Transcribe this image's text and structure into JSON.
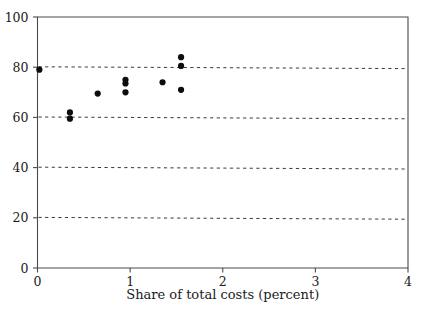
{
  "chart_data": {
    "type": "scatter",
    "title": "",
    "xlabel": "Share of total costs (percent)",
    "ylabel": "",
    "xlim": [
      0,
      4
    ],
    "ylim": [
      0,
      100
    ],
    "xticks": [
      0,
      1,
      2,
      3,
      4
    ],
    "xtick_labels": [
      "0",
      "1",
      "2",
      "3",
      "4"
    ],
    "yticks": [
      0,
      20,
      40,
      60,
      80,
      100
    ],
    "ytick_labels": [
      "0",
      "20",
      "40",
      "60",
      "80",
      "100"
    ],
    "grid": "horizontal-dashed",
    "gridline_values": [
      20,
      40,
      60,
      80
    ],
    "legend": "none",
    "marker": "filled-circle",
    "marker_color": "#0d0d0d",
    "points": [
      {
        "x": 0.02,
        "y": 79.0
      },
      {
        "x": 0.35,
        "y": 62.0
      },
      {
        "x": 0.35,
        "y": 59.5
      },
      {
        "x": 0.65,
        "y": 69.5
      },
      {
        "x": 0.95,
        "y": 75.0
      },
      {
        "x": 0.95,
        "y": 73.5
      },
      {
        "x": 0.95,
        "y": 70.0
      },
      {
        "x": 1.35,
        "y": 74.0
      },
      {
        "x": 1.55,
        "y": 84.0
      },
      {
        "x": 1.55,
        "y": 80.5
      },
      {
        "x": 1.55,
        "y": 71.0
      }
    ]
  }
}
